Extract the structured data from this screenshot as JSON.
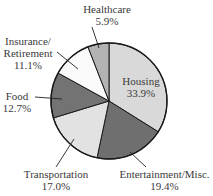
{
  "chart_data": {
    "type": "pie",
    "title": "",
    "start_angle_deg": 0,
    "direction": "clockwise",
    "slices": [
      {
        "label": "Housing",
        "value": 33.9,
        "pct_label": "33.9%",
        "color": "#d9d9d9"
      },
      {
        "label": "Entertainment/Misc.",
        "value": 19.4,
        "pct_label": "19.4%",
        "color": "#6f6f6f"
      },
      {
        "label": "Transportation",
        "value": 17.0,
        "pct_label": "17.0%",
        "color": "#e2e2e2"
      },
      {
        "label": "Food",
        "value": 12.7,
        "pct_label": "12.7%",
        "color": "#737373"
      },
      {
        "label": "Insurance/ Retirement",
        "value": 11.1,
        "pct_label": "11.1%",
        "color": "#fafafa"
      },
      {
        "label": "Healthcare",
        "value": 5.9,
        "pct_label": "5.9%",
        "color": "#b3b3b3"
      }
    ],
    "legend": "none",
    "labels_with_leader_lines": true
  },
  "labels": {
    "housing": {
      "name": "Housing",
      "pct": "33.9%"
    },
    "entertainment": {
      "name": "Entertainment/Misc.",
      "pct": "19.4%"
    },
    "transportation": {
      "name": "Transportation",
      "pct": "17.0%"
    },
    "food": {
      "name": "Food",
      "pct": "12.7%"
    },
    "insurance": {
      "name1": "Insurance/",
      "name2": "Retirement",
      "pct": "11.1%"
    },
    "healthcare": {
      "name": "Healthcare",
      "pct": "5.9%"
    }
  }
}
